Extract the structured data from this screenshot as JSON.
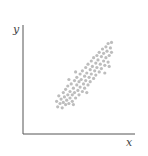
{
  "chart_data": {
    "type": "scatter",
    "title": "",
    "xlabel": "x",
    "ylabel": "y",
    "xlim": [
      0,
      100
    ],
    "ylim": [
      0,
      100
    ],
    "grid": false,
    "legend": null,
    "ticks": false,
    "series": [
      {
        "name": "points",
        "color": "#bdbdbd",
        "points": [
          [
            30,
            30
          ],
          [
            31,
            25
          ],
          [
            32,
            35
          ],
          [
            33,
            28
          ],
          [
            34,
            32
          ],
          [
            35,
            24
          ],
          [
            36,
            38
          ],
          [
            36,
            29
          ],
          [
            37,
            34
          ],
          [
            38,
            27
          ],
          [
            38,
            41
          ],
          [
            39,
            31
          ],
          [
            40,
            36
          ],
          [
            40,
            44
          ],
          [
            41,
            28
          ],
          [
            42,
            39
          ],
          [
            42,
            33
          ],
          [
            43,
            46
          ],
          [
            44,
            36
          ],
          [
            44,
            30
          ],
          [
            45,
            42
          ],
          [
            46,
            49
          ],
          [
            46,
            38
          ],
          [
            47,
            33
          ],
          [
            48,
            45
          ],
          [
            48,
            52
          ],
          [
            49,
            40
          ],
          [
            50,
            36
          ],
          [
            50,
            48
          ],
          [
            51,
            55
          ],
          [
            51,
            43
          ],
          [
            52,
            50
          ],
          [
            53,
            39
          ],
          [
            53,
            58
          ],
          [
            54,
            46
          ],
          [
            55,
            53
          ],
          [
            55,
            42
          ],
          [
            56,
            61
          ],
          [
            56,
            49
          ],
          [
            57,
            56
          ],
          [
            58,
            45
          ],
          [
            58,
            64
          ],
          [
            59,
            52
          ],
          [
            60,
            59
          ],
          [
            60,
            48
          ],
          [
            61,
            67
          ],
          [
            61,
            55
          ],
          [
            62,
            62
          ],
          [
            63,
            51
          ],
          [
            63,
            70
          ],
          [
            64,
            58
          ],
          [
            65,
            65
          ],
          [
            65,
            54
          ],
          [
            66,
            72
          ],
          [
            66,
            61
          ],
          [
            67,
            68
          ],
          [
            68,
            57
          ],
          [
            68,
            75
          ],
          [
            69,
            64
          ],
          [
            70,
            71
          ],
          [
            70,
            60
          ],
          [
            71,
            78
          ],
          [
            72,
            67
          ],
          [
            72,
            74
          ],
          [
            73,
            63
          ],
          [
            74,
            80
          ],
          [
            74,
            70
          ],
          [
            75,
            76
          ],
          [
            76,
            66
          ],
          [
            76,
            83
          ],
          [
            77,
            72
          ],
          [
            78,
            79
          ],
          [
            79,
            75
          ],
          [
            79,
            84
          ],
          [
            77,
            62
          ],
          [
            73,
            56
          ],
          [
            57,
            38
          ],
          [
            45,
            27
          ],
          [
            41,
            50
          ],
          [
            47,
            57
          ]
        ]
      }
    ]
  },
  "axes": {
    "x_label": "x",
    "y_label": "y",
    "color": "#555555"
  }
}
